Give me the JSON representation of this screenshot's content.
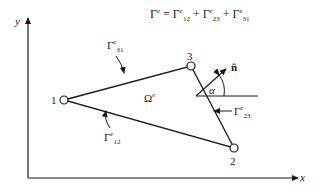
{
  "equation": {
    "lhs": "Γ",
    "lhs_sup": "e",
    "eq": " = ",
    "terms": [
      {
        "sym": "Γ",
        "sup": "e",
        "sub": "12"
      },
      {
        "sym": "Γ",
        "sup": "e",
        "sub": "23"
      },
      {
        "sym": "Γ",
        "sup": "e",
        "sub": "31"
      }
    ],
    "plus": " + "
  },
  "axes": {
    "x_label": "x",
    "y_label": "y"
  },
  "nodes": [
    {
      "label": "1"
    },
    {
      "label": "2"
    },
    {
      "label": "3"
    }
  ],
  "element": {
    "sym": "Ω",
    "sup": "e"
  },
  "edges": {
    "e31": {
      "sym": "Γ",
      "sup": "e",
      "sub": "31"
    },
    "e23": {
      "sym": "Γ",
      "sup": "e",
      "sub": "23"
    },
    "e12": {
      "sym": "Γ",
      "sup": "e",
      "sub": "12"
    }
  },
  "normal": {
    "label": "n̂",
    "angle": "α"
  }
}
